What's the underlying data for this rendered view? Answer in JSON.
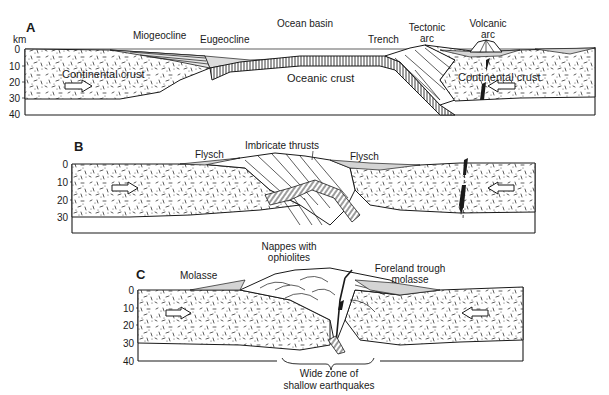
{
  "figure": {
    "axis_unit": "km",
    "panels": [
      {
        "id": "A",
        "letter": "A",
        "depth_ticks": [
          "0",
          "10",
          "20",
          "30",
          "40"
        ],
        "labels": {
          "miogeocline": "Miogeocline",
          "eugeocline": "Eugeocline",
          "ocean_basin": "Ocean basin",
          "trench": "Trench",
          "tectonic_arc_1": "Tectonic",
          "tectonic_arc_2": "arc",
          "volcanic_arc_1": "Volcanic",
          "volcanic_arc_2": "arc",
          "continental_crust_left": "Continental crust",
          "oceanic_crust": "Oceanic crust",
          "continental_crust_right": "Continental crust"
        }
      },
      {
        "id": "B",
        "letter": "B",
        "depth_ticks": [
          "0",
          "10",
          "20",
          "30"
        ],
        "labels": {
          "flysch_left": "Flysch",
          "imbricate_thrusts": "Imbricate thrusts",
          "flysch_right": "Flysch"
        }
      },
      {
        "id": "C",
        "letter": "C",
        "depth_ticks": [
          "0",
          "10",
          "20",
          "30",
          "40"
        ],
        "labels": {
          "molasse": "Molasse",
          "nappes_1": "Nappes with",
          "nappes_2": "ophiolites",
          "foreland_1": "Foreland trough",
          "foreland_2": "molasse",
          "earthquakes_1": "Wide zone of",
          "earthquakes_2": "shallow earthquakes"
        }
      }
    ],
    "colors": {
      "ink": "#1a1a1a",
      "background": "#ffffff",
      "sediment_fill": "#d4d4d4"
    }
  }
}
